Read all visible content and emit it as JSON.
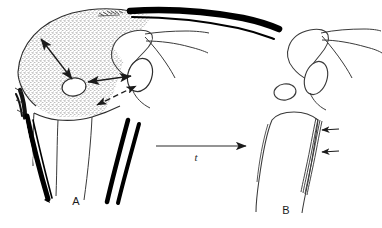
{
  "figure": {
    "background_color": "#ffffff",
    "ink_color": "#1b1b1b",
    "stipple_color": "#6e6e6e",
    "panels": [
      {
        "id": "A",
        "label": "A",
        "label_x": 76,
        "label_y": 205,
        "description": "Stippled subacromial soft-tissue region with double-headed measurement arrows"
      },
      {
        "id": "B",
        "label": "B",
        "label_x": 286,
        "label_y": 214,
        "description": "Proximal humerus outline with longitudinal striations marked by two small arrows"
      }
    ],
    "transition": {
      "label": "t",
      "label_x": 196,
      "label_y": 161,
      "arrow": {
        "name": "time-arrow",
        "x1": 156,
        "y1": 146,
        "x2": 246,
        "y2": 146,
        "style": "solid-single-head-right"
      }
    },
    "arrows_panel_a": [
      {
        "name": "measure-arrow-diagonal",
        "style": "solid-double-head",
        "x1": 41,
        "y1": 39,
        "x2": 72,
        "y2": 79
      },
      {
        "name": "measure-arrow-horizontal",
        "style": "solid-double-head",
        "x1": 87,
        "y1": 81,
        "x2": 132,
        "y2": 77
      },
      {
        "name": "measure-arrow-dashed",
        "style": "dashed-double-head",
        "x1": 97,
        "y1": 104,
        "x2": 137,
        "y2": 85
      }
    ],
    "arrows_panel_b": [
      {
        "name": "striation-pointer-upper",
        "x1": 338,
        "y1": 130,
        "x2": 322,
        "y2": 130
      },
      {
        "name": "striation-pointer-lower",
        "x1": 338,
        "y1": 152,
        "x2": 322,
        "y2": 152
      }
    ],
    "colors": {
      "ink": "#1b1b1b",
      "line": "#3a3a3a",
      "stipple": "#707070",
      "solid_black": "#000000",
      "paper": "#ffffff"
    }
  }
}
